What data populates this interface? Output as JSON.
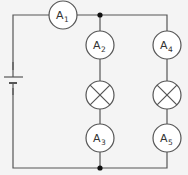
{
  "diagram": {
    "type": "parallel circuit",
    "background": "#f4f4f4",
    "line_color": "#555555",
    "components": {
      "battery": {
        "label": ""
      },
      "ammeters": [
        {
          "id": "A1",
          "main": "A",
          "sub": "1",
          "position": "main line top"
        },
        {
          "id": "A2",
          "main": "A",
          "sub": "2",
          "position": "left branch top"
        },
        {
          "id": "A3",
          "main": "A",
          "sub": "3",
          "position": "left branch bottom"
        },
        {
          "id": "A4",
          "main": "A",
          "sub": "4",
          "position": "right branch top"
        },
        {
          "id": "A5",
          "main": "A",
          "sub": "5",
          "position": "right branch bottom"
        }
      ],
      "lamps": [
        {
          "id": "L1",
          "position": "left branch middle"
        },
        {
          "id": "L2",
          "position": "right branch middle"
        }
      ],
      "junctions": [
        {
          "id": "J1",
          "position": "top"
        },
        {
          "id": "J2",
          "position": "bottom"
        }
      ]
    }
  }
}
